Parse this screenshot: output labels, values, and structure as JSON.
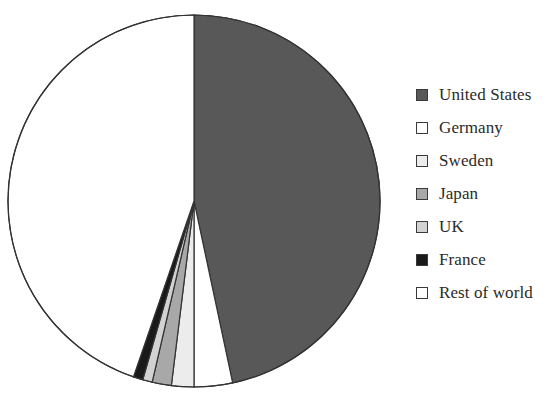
{
  "chart_data": {
    "type": "pie",
    "title": "",
    "subtitle": "",
    "xlabel": "",
    "ylabel": "",
    "grid": false,
    "legend_position": "right",
    "start_angle_deg": 0,
    "direction": "clockwise",
    "categories": [
      "United States",
      "Germany",
      "Sweden",
      "Japan",
      "UK",
      "France",
      "Rest of world"
    ],
    "values": [
      46.7,
      3.3,
      1.9,
      1.7,
      0.8,
      0.8,
      44.8
    ],
    "units": "percent",
    "series": [
      {
        "name": "Share",
        "values": [
          46.7,
          3.3,
          1.9,
          1.7,
          0.8,
          0.8,
          44.8
        ]
      }
    ],
    "slices": [
      {
        "label": "United States",
        "value": 46.7,
        "color": "#585858",
        "start_deg": 0,
        "end_deg": 168.0,
        "swatch_color": "#585858"
      },
      {
        "label": "Germany",
        "value": 3.3,
        "color": "#ffffff",
        "start_deg": 168.0,
        "end_deg": 180.0,
        "swatch_color": "#ffffff"
      },
      {
        "label": "Sweden",
        "value": 1.9,
        "color": "#ececec",
        "start_deg": 180.0,
        "end_deg": 187.0,
        "swatch_color": "#ececec"
      },
      {
        "label": "Japan",
        "value": 1.7,
        "color": "#a8a8a8",
        "start_deg": 187.0,
        "end_deg": 193.0,
        "swatch_color": "#a8a8a8"
      },
      {
        "label": "UK",
        "value": 0.8,
        "color": "#d2d2d2",
        "start_deg": 193.0,
        "end_deg": 196.0,
        "swatch_color": "#d2d2d2"
      },
      {
        "label": "France",
        "value": 0.8,
        "color": "#1a1a1a",
        "start_deg": 196.0,
        "end_deg": 199.0,
        "swatch_color": "#1a1a1a"
      },
      {
        "label": "Rest of world",
        "value": 44.8,
        "color": "#ffffff",
        "start_deg": 199.0,
        "end_deg": 360.0,
        "swatch_color": "#ffffff"
      }
    ],
    "geometry": {
      "center_x": 194,
      "center_y": 201,
      "radius": 186,
      "outline_color": "#333333",
      "outline_width": 1.2
    }
  },
  "legend": {
    "items": [
      {
        "label": "United States",
        "color": "#585858"
      },
      {
        "label": "Germany",
        "color": "#ffffff"
      },
      {
        "label": "Sweden",
        "color": "#ececec"
      },
      {
        "label": "Japan",
        "color": "#a8a8a8"
      },
      {
        "label": "UK",
        "color": "#d2d2d2"
      },
      {
        "label": "France",
        "color": "#1a1a1a"
      },
      {
        "label": "Rest of world",
        "color": "#ffffff"
      }
    ]
  }
}
